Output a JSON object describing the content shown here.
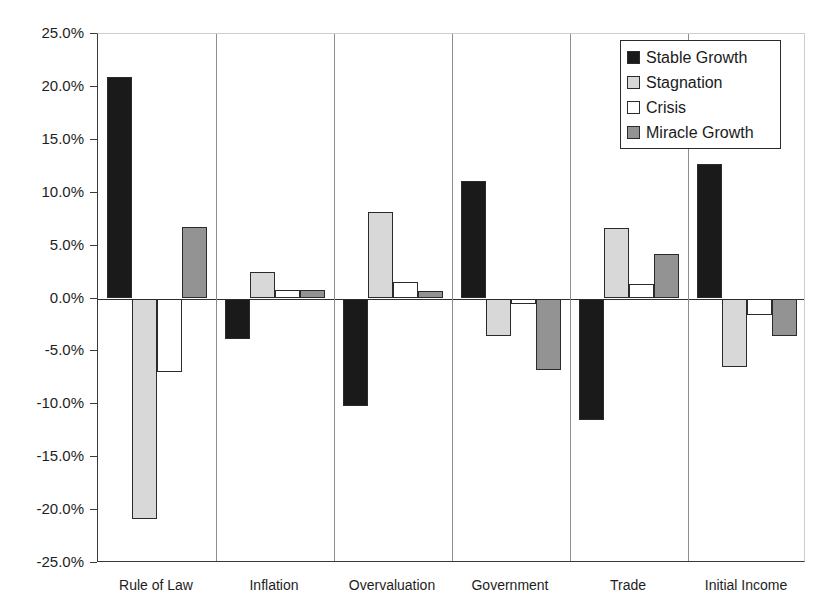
{
  "chart_data": {
    "type": "bar",
    "title": "",
    "xlabel": "",
    "ylabel": "",
    "ylim": [
      -25,
      25
    ],
    "grid": false,
    "legend_position": "top-right",
    "ytick_labels": [
      "25.0%",
      "20.0%",
      "15.0%",
      "10.0%",
      "5.0%",
      "0.0%",
      "-5.0%",
      "-10.0%",
      "-15.0%",
      "-20.0%",
      "-25.0%"
    ],
    "ytick_values": [
      25,
      20,
      15,
      10,
      5,
      0,
      -5,
      -10,
      -15,
      -20,
      -25
    ],
    "categories": [
      "Rule of Law",
      "Inflation",
      "Overvaluation",
      "Government",
      "Trade",
      "Initial Income"
    ],
    "series": [
      {
        "name": "Stable Growth",
        "color": "#1a1a1a",
        "values": [
          20.9,
          -3.8,
          -10.2,
          11.1,
          -11.5,
          12.7
        ]
      },
      {
        "name": "Stagnation",
        "color": "#d8d8d8",
        "values": [
          -20.8,
          2.5,
          8.2,
          -3.5,
          6.7,
          -6.5
        ]
      },
      {
        "name": "Crisis",
        "color": "#ffffff",
        "values": [
          -6.9,
          0.8,
          1.6,
          -0.5,
          1.4,
          -1.6
        ]
      },
      {
        "name": "Miracle Growth",
        "color": "#939393",
        "values": [
          6.8,
          0.85,
          0.7,
          -6.8,
          4.2,
          -3.5
        ]
      }
    ]
  }
}
